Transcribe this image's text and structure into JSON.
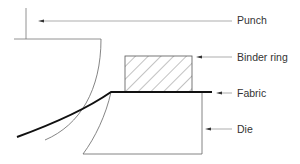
{
  "diagram": {
    "type": "schematic cross-section",
    "labels": {
      "punch": "Punch",
      "binder_ring": "Binder ring",
      "fabric": "Fabric",
      "die": "Die"
    },
    "colors": {
      "line": "#555555",
      "fabric": "#111111",
      "text": "#333333"
    }
  }
}
